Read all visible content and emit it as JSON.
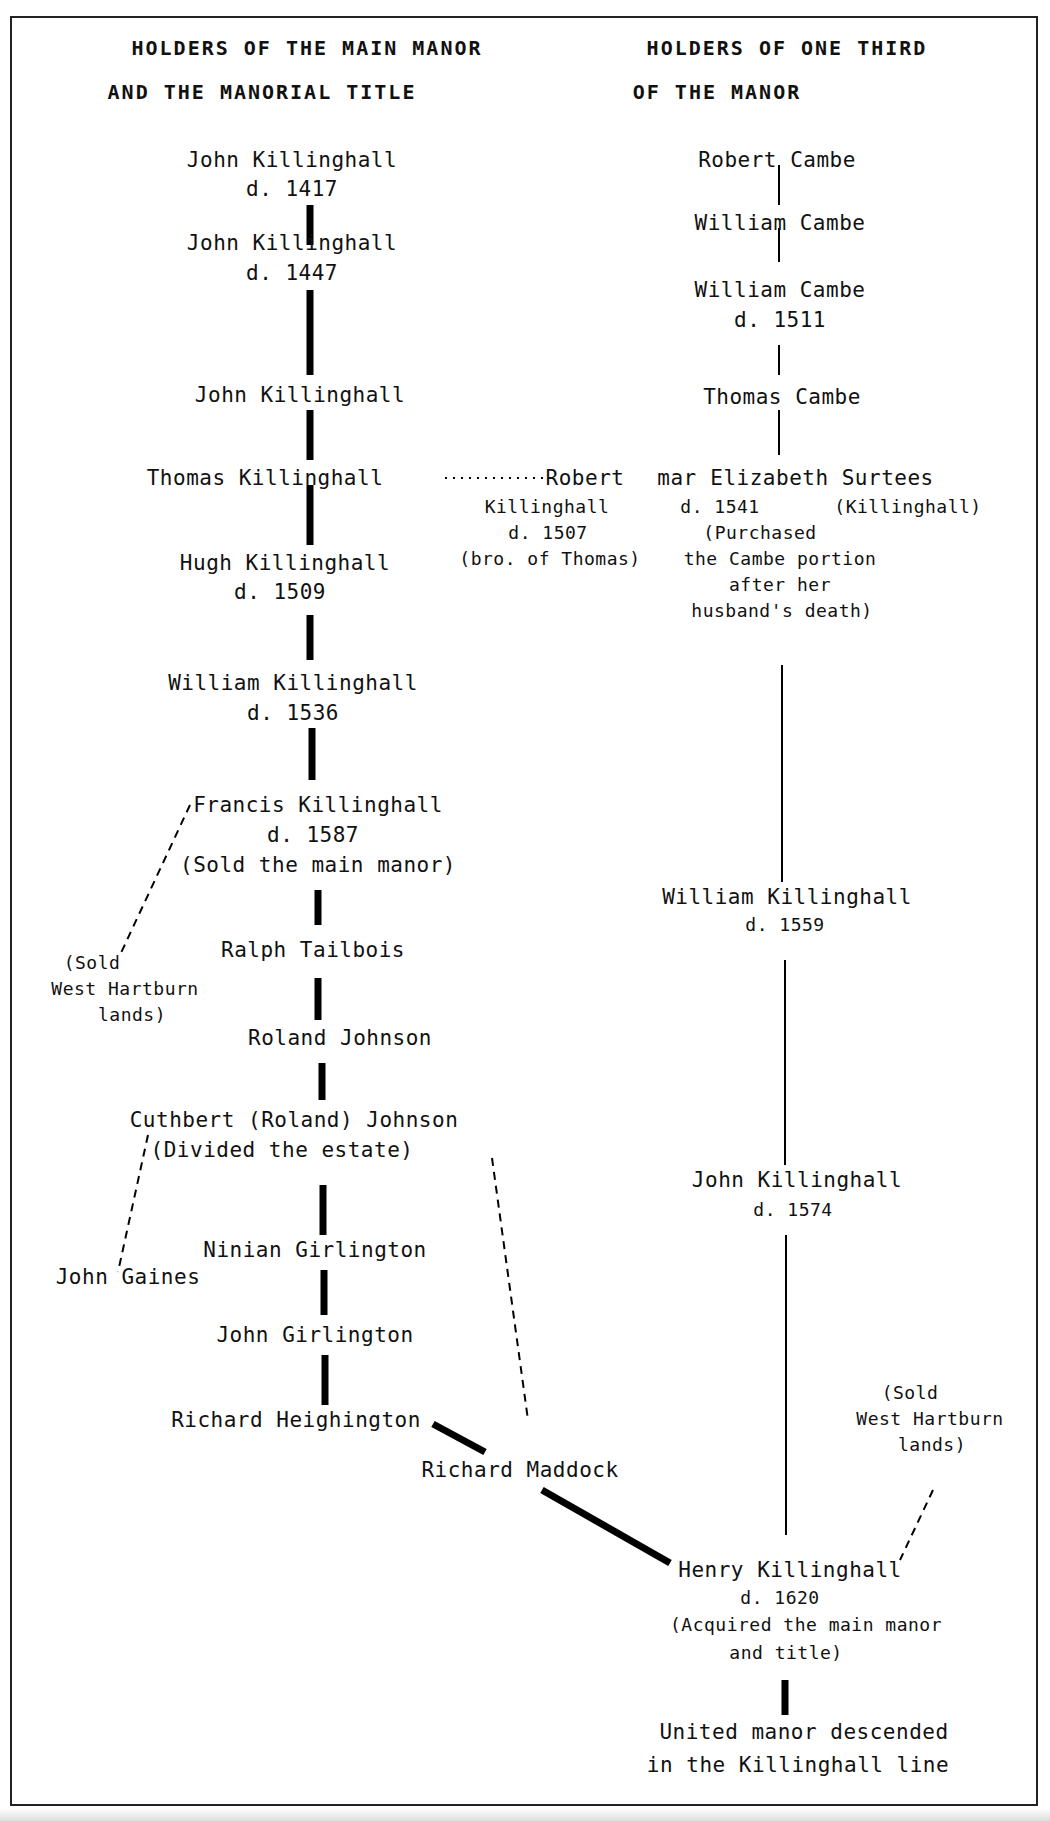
{
  "headers": {
    "left_line1": "HOLDERS OF THE MAIN MANOR",
    "left_line2": "AND THE MANORIAL TITLE",
    "right_line1": "HOLDERS OF ONE THIRD",
    "right_line2": "OF THE MANOR"
  },
  "main_manor": [
    {
      "name": "John Killinghall",
      "note": "d. 1417"
    },
    {
      "name": "John Killinghall",
      "note": "d. 1447"
    },
    {
      "name": "John Killinghall",
      "note": ""
    },
    {
      "name": "Thomas Killinghall",
      "note": ""
    },
    {
      "name": "Hugh Killinghall",
      "note": "d. 1509"
    },
    {
      "name": "William Killinghall",
      "note": "d. 1536"
    },
    {
      "name": "Francis Killinghall",
      "note": "d. 1587",
      "note2": "(Sold the main manor)"
    },
    {
      "name": "Ralph Tailbois",
      "note": ""
    },
    {
      "name": "Roland Johnson",
      "note": ""
    },
    {
      "name": "Cuthbert (Roland) Johnson",
      "note": "(Divided the estate)"
    },
    {
      "name": "Ninian Girlington",
      "note": ""
    },
    {
      "name": "John Girlington",
      "note": ""
    },
    {
      "name": "Richard Heighington",
      "note": ""
    },
    {
      "name": "Richard Maddock",
      "note": ""
    }
  ],
  "third_manor": [
    {
      "name": "Robert Cambe",
      "note": ""
    },
    {
      "name": "William Cambe",
      "note": ""
    },
    {
      "name": "William Cambe",
      "note": "d. 1511"
    },
    {
      "name": "Thomas Cambe",
      "note": ""
    },
    {
      "name": "Elizabeth Surtees",
      "note": "d. 1541",
      "married_name": "(Killinghall)",
      "note_lines": [
        "(Purchased",
        "the Cambe portion",
        "after her",
        "husband's death)"
      ]
    },
    {
      "name": "William Killinghall",
      "note": "d. 1559"
    },
    {
      "name": "John Killinghall",
      "note": "d. 1574"
    }
  ],
  "robert": {
    "name_part1": "Robert",
    "marriage": "mar",
    "name_part2": "Killinghall",
    "note": "d. 1507",
    "relation": "(bro. of Thomas)"
  },
  "side_notes": {
    "west_hartburn_left": [
      "(Sold",
      "West Hartburn",
      "lands)"
    ],
    "john_gaines": "John Gaines",
    "west_hartburn_right": [
      "(Sold",
      "West Hartburn",
      "lands)"
    ]
  },
  "henry": {
    "name": "Henry Killinghall",
    "note": "d. 1620",
    "note_lines": [
      "(Acquired the main manor",
      "and title)"
    ]
  },
  "final": {
    "line1": "United manor descended",
    "line2": "in the Killinghall line"
  }
}
